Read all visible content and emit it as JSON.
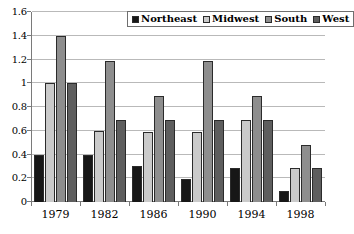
{
  "chart_data": {
    "type": "bar",
    "title": "",
    "subtitle": "",
    "xlabel": "",
    "ylabel": "",
    "categories": [
      "1979",
      "1982",
      "1986",
      "1990",
      "1994",
      "1998"
    ],
    "series": [
      {
        "name": "Northeast",
        "color": "#171717",
        "values": [
          0.4,
          0.4,
          0.3,
          0.19,
          0.29,
          0.09
        ]
      },
      {
        "name": "Midwest",
        "color": "#cacaca",
        "values": [
          1.0,
          0.6,
          0.59,
          0.59,
          0.69,
          0.285
        ]
      },
      {
        "name": "South",
        "color": "#8e8e8e",
        "values": [
          1.4,
          1.19,
          0.89,
          1.19,
          0.89,
          0.48
        ]
      },
      {
        "name": "West",
        "color": "#5e5e5e",
        "values": [
          1.0,
          0.69,
          0.69,
          0.69,
          0.69,
          0.285
        ]
      }
    ],
    "ylim": [
      0,
      1.6
    ],
    "ytick_step": 0.2,
    "yticks": [
      "0",
      "0.2",
      "0.4",
      "0.6",
      "0.8",
      "1",
      "1.2",
      "1.4",
      "1.6"
    ],
    "grid": "horizontal",
    "legend_position": "top-center-inside",
    "legend": [
      "Northeast",
      "Midwest",
      "South",
      "West"
    ]
  }
}
